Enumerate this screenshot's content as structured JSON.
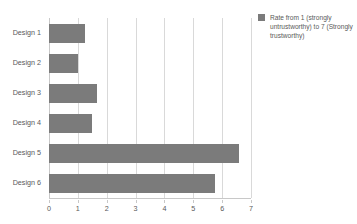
{
  "chart_data": {
    "type": "bar",
    "orientation": "horizontal",
    "title": "",
    "subtitle": "",
    "xlabel": "",
    "ylabel": "",
    "categories": [
      "Design 1",
      "Design 2",
      "Design 3",
      "Design 4",
      "Design 5",
      "Design 6"
    ],
    "values": [
      1.25,
      1.0,
      1.65,
      1.5,
      6.6,
      5.75
    ],
    "series": [
      {
        "name": "Rate from 1 (strongly untrustworthy) to 7 (Strongly trustworthy)",
        "values": [
          1.25,
          1.0,
          1.65,
          1.5,
          6.6,
          5.75
        ],
        "color": "#7b7b7b"
      }
    ],
    "xlim": [
      0,
      7
    ],
    "xticks": [
      "0",
      "1",
      "2",
      "3",
      "4",
      "5",
      "6",
      "7"
    ],
    "yticks": [
      "Design 1",
      "Design 2",
      "Design 3",
      "Design 4",
      "Design 5",
      "Design 6"
    ],
    "grid": true,
    "grid_axis": "x",
    "legend_position": "right",
    "background_color": "#ffffff",
    "grid_color": "#d9d9d9",
    "text_color": "#595959"
  },
  "legend": {
    "label": "Rate from 1 (strongly untrustworthy) to 7 (Strongly trustworthy)",
    "swatch_color": "#7b7b7b"
  }
}
